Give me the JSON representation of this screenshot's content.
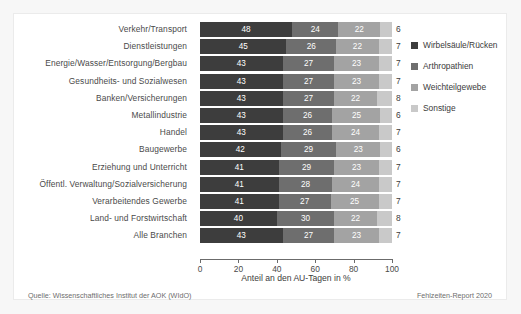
{
  "chart_data": {
    "type": "bar",
    "orientation": "horizontal",
    "stacked": true,
    "normalized_percent": true,
    "title": "",
    "xlabel": "Anteil an den AU-Tagen in %",
    "ylabel": "",
    "xlim": [
      0,
      100
    ],
    "xticks": [
      0,
      20,
      40,
      60,
      80,
      100
    ],
    "grid": false,
    "legend_position": "right",
    "categories": [
      "Verkehr/Transport",
      "Dienstleistungen",
      "Energie/Wasser/Entsorgung/Bergbau",
      "Gesundheits- und Sozialwesen",
      "Banken/Versicherungen",
      "Metallindustrie",
      "Handel",
      "Baugewerbe",
      "Erziehung und Unterricht",
      "Öffentl. Verwaltung/Sozialversicherung",
      "Verarbeitendes Gewerbe",
      "Land- und Forstwirtschaft",
      "Alle Branchen"
    ],
    "series": [
      {
        "name": "Wirbelsäule/Rücken",
        "color": "#3d3d3d",
        "values": [
          48,
          45,
          43,
          43,
          43,
          43,
          43,
          42,
          41,
          41,
          41,
          40,
          43
        ]
      },
      {
        "name": "Arthropathien",
        "color": "#6e6e6e",
        "values": [
          24,
          26,
          27,
          27,
          27,
          26,
          26,
          29,
          29,
          28,
          27,
          30,
          27
        ]
      },
      {
        "name": "Weichteilgewebe",
        "color": "#a3a3a3",
        "values": [
          22,
          22,
          23,
          23,
          22,
          25,
          24,
          23,
          23,
          24,
          25,
          22,
          23
        ]
      },
      {
        "name": "Sonstige",
        "color": "#c9c9c9",
        "values": [
          6,
          7,
          7,
          7,
          8,
          6,
          7,
          6,
          7,
          7,
          7,
          8,
          7
        ]
      }
    ]
  },
  "footer": {
    "source": "Quelle: Wissenschaftliches Institut der AOK (WIdO)",
    "report": "Fehlzeiten-Report 2020"
  }
}
